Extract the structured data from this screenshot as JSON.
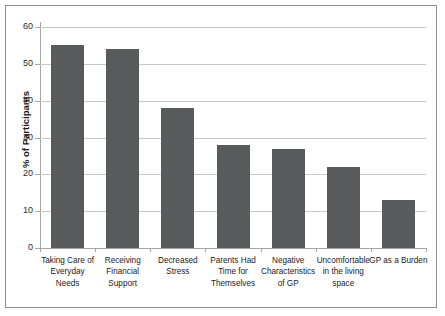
{
  "chart_data": {
    "type": "bar",
    "title": "",
    "xlabel": "",
    "ylabel": "% of Participants",
    "ylim": [
      0,
      60
    ],
    "ytick_values": [
      0,
      10,
      20,
      30,
      40,
      50,
      60
    ],
    "ytick_labels": [
      "0",
      "10",
      "20",
      "30",
      "40",
      "50",
      "60"
    ],
    "grid": true,
    "legend": "none",
    "bar_color": "#595a5c",
    "gridline_color": "#c9c9c9",
    "axis_color": "#a6a6a6",
    "categories": [
      "Taking Care of Everyday Needs",
      "Receiving Financial Support",
      "Decreased Stress",
      "Parents Had Time for Themselves",
      "Negative Characteristics of GP",
      "Uncomfortable in the living space",
      "GP as a Burden"
    ],
    "category_lines": [
      [
        "Taking Care of",
        "Everyday",
        "Needs"
      ],
      [
        "Receiving",
        "Financial",
        "Support"
      ],
      [
        "Decreased",
        "Stress"
      ],
      [
        "Parents Had",
        "Time for",
        "Themselves"
      ],
      [
        "Negative",
        "Characteristics",
        "of GP"
      ],
      [
        "Uncomfortable",
        "in the living",
        "space"
      ],
      [
        "GP as a Burden"
      ]
    ],
    "values": [
      55,
      54,
      38,
      28,
      27,
      22,
      13
    ]
  }
}
